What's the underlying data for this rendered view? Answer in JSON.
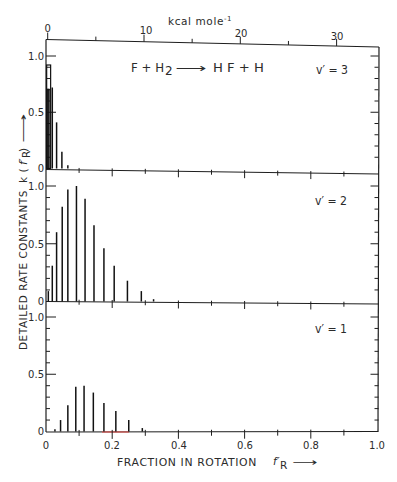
{
  "labels": {
    "top_axis": {
      "unit": "kcal mole",
      "unit_exponent": "-1"
    },
    "reaction": {
      "lhs": "F + H",
      "lhs_sub": "2",
      "arrow": "⟶",
      "rhs": "H F + H"
    },
    "x_axis": {
      "title": "FRACTION IN ROTATION",
      "symbol": "f′",
      "symbol_sub": "R",
      "arrow": "⟶"
    },
    "y_axis": {
      "title": "DETAILED RATE CONSTANTS",
      "symbol_prefix": "k (",
      "symbol": "f′",
      "symbol_sub": "R",
      "symbol_suffix": ")",
      "arrow": "⟶"
    }
  },
  "chart_data": {
    "type": "bar",
    "xlabel": "FRACTION IN ROTATION f′R",
    "ylabel": "DETAILED RATE CONSTANTS k(f′R)",
    "xlim": [
      0,
      1.0
    ],
    "ylim": [
      0,
      1.0
    ],
    "grid": false,
    "layout": "three vertically stacked panels sharing the x-axis",
    "xtick_labels": [
      "0",
      "0.2",
      "0.4",
      "0.6",
      "0.8",
      "1.0"
    ],
    "ytick_labels": [
      "0",
      "0.5",
      "1.0"
    ],
    "secondary_xaxis": {
      "position": "top",
      "label": "kcal mole-1",
      "tick_labels": [
        "0",
        "10",
        "20",
        "30"
      ]
    },
    "panels": [
      {
        "label": "v′ = 3",
        "x": [
          0.003,
          0.006,
          0.009,
          0.019,
          0.032,
          0.048,
          0.066
        ],
        "values": [
          0.71,
          0.71,
          0.71,
          0.72,
          0.41,
          0.15,
          0.03
        ],
        "envelope": {
          "x_start": 0.002,
          "x_end": 0.014,
          "value": 0.92
        }
      },
      {
        "label": "v′ = 2",
        "x": [
          0.007,
          0.019,
          0.032,
          0.049,
          0.066,
          0.092,
          0.118,
          0.145,
          0.175,
          0.206,
          0.246,
          0.288,
          0.325
        ],
        "values": [
          0.09,
          0.31,
          0.6,
          0.82,
          0.97,
          1.0,
          0.89,
          0.66,
          0.46,
          0.31,
          0.18,
          0.09,
          0.02
        ]
      },
      {
        "label": "v′ = 1",
        "x": [
          0.027,
          0.044,
          0.066,
          0.09,
          0.115,
          0.143,
          0.175,
          0.211,
          0.25,
          0.291
        ],
        "values": [
          0.02,
          0.1,
          0.23,
          0.39,
          0.4,
          0.34,
          0.25,
          0.18,
          0.1,
          0.03
        ]
      }
    ]
  }
}
